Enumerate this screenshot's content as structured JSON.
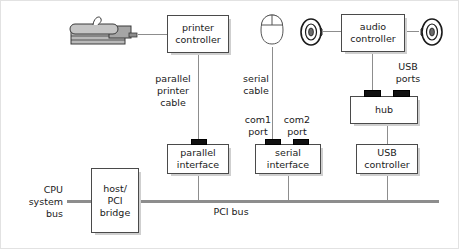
{
  "diagram": {
    "colors": {
      "wire": "#8d8d8d",
      "box_border": "#4a4a4a",
      "box_fill": "#ffffff",
      "port_fill": "#111111",
      "shadow": "#cfcfcf",
      "text": "#1a1a1a",
      "frame": "#e2e2e2"
    },
    "nodes": [
      {
        "id": "printer-controller",
        "label_line1": "printer",
        "label_line2": "controller"
      },
      {
        "id": "audio-controller",
        "label_line1": "audio",
        "label_line2": "controller"
      },
      {
        "id": "hub",
        "label_line1": "hub",
        "label_line2": ""
      },
      {
        "id": "parallel-interface",
        "label_line1": "parallel",
        "label_line2": "interface"
      },
      {
        "id": "serial-interface",
        "label_line1": "serial",
        "label_line2": "interface"
      },
      {
        "id": "usb-controller",
        "label_line1": "USB",
        "label_line2": "controller"
      },
      {
        "id": "host-pci-bridge",
        "label_line1": "host/",
        "label_line2": "PCI",
        "label_line3": "bridge"
      }
    ],
    "labels": {
      "parallel_printer_cable_l1": "parallel",
      "parallel_printer_cable_l2": "printer",
      "parallel_printer_cable_l3": "cable",
      "serial_cable_l1": "serial",
      "serial_cable_l2": "cable",
      "com1_l1": "com1",
      "com1_l2": "port",
      "com2_l1": "com2",
      "com2_l2": "port",
      "usb_ports_l1": "USB",
      "usb_ports_l2": "ports",
      "cpu_system_bus_l1": "CPU",
      "cpu_system_bus_l2": "system",
      "cpu_system_bus_l3": "bus",
      "pci_bus": "PCI bus"
    },
    "icons": {
      "printer": "printer-icon",
      "mouse": "mouse-icon",
      "speaker_left": "speaker-icon",
      "speaker_right": "speaker-icon"
    }
  }
}
